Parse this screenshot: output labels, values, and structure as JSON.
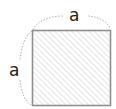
{
  "diagram": {
    "shape": "square",
    "top_label": "a",
    "left_label": "a",
    "colors": {
      "border": "#8f8f8f",
      "hatch": "#d6d6d6",
      "dim_line": "#9a9a9a",
      "label": "#222222"
    }
  }
}
